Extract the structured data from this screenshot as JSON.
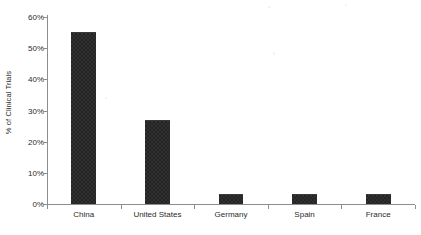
{
  "chart_data": {
    "type": "bar",
    "title": "",
    "subtitle": "",
    "xlabel": "",
    "ylabel": "% of Clinical Trials",
    "categories": [
      "China",
      "United States",
      "Germany",
      "Spain",
      "France"
    ],
    "values": [
      55.3,
      26.8,
      3.2,
      3.1,
      3.1
    ],
    "series": [
      {
        "name": "% of Clinical Trials",
        "values": [
          55.3,
          26.8,
          3.2,
          3.1,
          3.1
        ]
      }
    ],
    "ylim": [
      0,
      60
    ],
    "ytick_values": [
      0,
      10,
      20,
      30,
      40,
      50,
      60
    ],
    "ytick_labels": [
      "0%",
      "10%",
      "20%",
      "30%",
      "40%",
      "50%",
      "60%"
    ],
    "grid": false,
    "legend": false,
    "legend_position": "none",
    "bar_color": "#242424",
    "axis_color": "#8d8d8d",
    "text_color": "#2b2b2b",
    "background_color": "#ffffff",
    "annotations": []
  }
}
